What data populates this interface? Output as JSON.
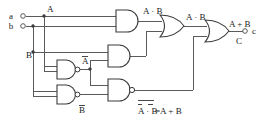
{
  "diagram": {
    "inputs": [
      {
        "terminal": "a",
        "signal": "A"
      },
      {
        "terminal": "b",
        "signal": "B"
      }
    ],
    "output": {
      "terminal": "c",
      "signal": "C"
    },
    "labels": {
      "input_a": "a",
      "input_b": "b",
      "signal_A": "A",
      "signal_B": "B",
      "not_A": "A",
      "not_B": "B",
      "and_top_out": "A · B",
      "or_mid_out": "A · B",
      "final_out": "A + B",
      "output_c": "c",
      "output_C": "C",
      "demorgan_left": "A · B",
      "demorgan_right": "=A + B"
    },
    "colors": {
      "wire": "#5a5a5a",
      "gate": "#3a3a3a",
      "text": "#1a1a1a",
      "background": "#ffffff"
    }
  }
}
